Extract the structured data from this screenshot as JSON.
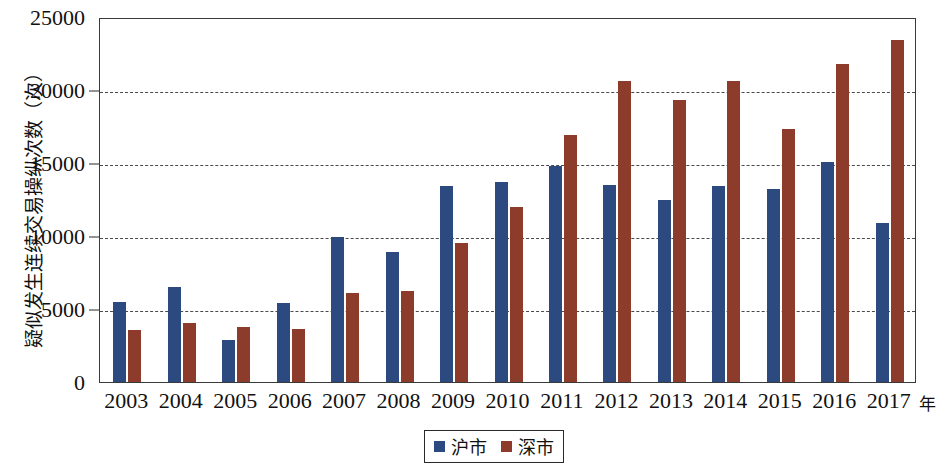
{
  "chart_data": {
    "type": "bar",
    "title": "",
    "xlabel": "年",
    "ylabel": "疑似发生连续交易操纵次数（次）",
    "ylim": [
      0,
      25000
    ],
    "ytick_values": [
      0,
      5000,
      10000,
      15000,
      20000,
      25000
    ],
    "ytick_labels": [
      "0",
      "5000",
      "10000",
      "15000",
      "20000",
      "25000"
    ],
    "grid": "horizontal-dashed",
    "legend_position": "bottom-center",
    "categories": [
      "2003",
      "2004",
      "2005",
      "2006",
      "2007",
      "2008",
      "2009",
      "2010",
      "2011",
      "2012",
      "2013",
      "2014",
      "2015",
      "2016",
      "2017"
    ],
    "series": [
      {
        "name": "沪市",
        "color": "#2c4a80",
        "values": [
          5500,
          6500,
          2900,
          5400,
          9900,
          8900,
          13400,
          13700,
          14800,
          13500,
          12500,
          13400,
          13200,
          15100,
          10900
        ]
      },
      {
        "name": "深市",
        "color": "#8d3c2b",
        "values": [
          3550,
          4050,
          3800,
          3600,
          6100,
          6250,
          9500,
          12000,
          16900,
          20600,
          19300,
          20600,
          17300,
          21800,
          23400
        ]
      }
    ]
  },
  "legend": {
    "items": [
      {
        "label": "沪市",
        "color": "#2c4a80"
      },
      {
        "label": "深市",
        "color": "#8d3c2b"
      }
    ]
  }
}
